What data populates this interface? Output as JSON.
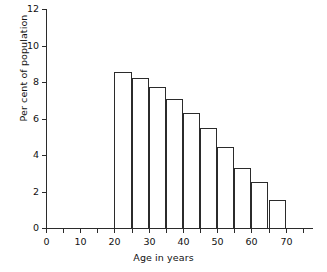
{
  "chart_data": {
    "type": "bar",
    "title": "",
    "subtitle": "",
    "xlabel": "Age in years",
    "ylabel": "Per cent of population",
    "xlim": [
      0,
      78
    ],
    "ylim": [
      0,
      12
    ],
    "grid": false,
    "legend": null,
    "bar_style": "histogram, unfilled bars with black outline",
    "bin_width": 5,
    "x_tick_labels": [
      "0",
      "10",
      "20",
      "30",
      "40",
      "50",
      "60",
      "70"
    ],
    "x_tick_values": [
      0,
      10,
      20,
      30,
      40,
      50,
      60,
      70
    ],
    "x_minor_tick_values": [
      5,
      15,
      25,
      35,
      45,
      55,
      65,
      75
    ],
    "y_tick_labels": [
      "0",
      "2",
      "4",
      "6",
      "8",
      "10",
      "12"
    ],
    "y_tick_values": [
      0,
      2,
      4,
      6,
      8,
      10,
      12
    ],
    "categories": [
      "20-25",
      "25-30",
      "30-35",
      "35-40",
      "40-45",
      "45-50",
      "50-55",
      "55-60",
      "60-65",
      "65-70"
    ],
    "bin_edges": [
      20,
      25,
      30,
      35,
      40,
      45,
      50,
      55,
      60,
      65,
      70
    ],
    "values": [
      8.55,
      8.2,
      7.75,
      7.05,
      6.3,
      5.5,
      4.45,
      3.3,
      2.5,
      1.55
    ],
    "bars": [
      {
        "x0": 20,
        "x1": 25,
        "value": 8.55
      },
      {
        "x0": 25,
        "x1": 30,
        "value": 8.2
      },
      {
        "x0": 30,
        "x1": 35,
        "value": 7.75
      },
      {
        "x0": 35,
        "x1": 40,
        "value": 7.05
      },
      {
        "x0": 40,
        "x1": 45,
        "value": 6.3
      },
      {
        "x0": 45,
        "x1": 50,
        "value": 5.5
      },
      {
        "x0": 50,
        "x1": 55,
        "value": 4.45
      },
      {
        "x0": 55,
        "x1": 60,
        "value": 3.3
      },
      {
        "x0": 60,
        "x1": 65,
        "value": 2.5
      },
      {
        "x0": 65,
        "x1": 70,
        "value": 1.55
      }
    ],
    "colors": {
      "axis": "#2b2b2b",
      "bar_outline": "#2b2b2b",
      "bar_fill": "#ffffff",
      "background": "#ffffff",
      "text": "#111111"
    }
  }
}
